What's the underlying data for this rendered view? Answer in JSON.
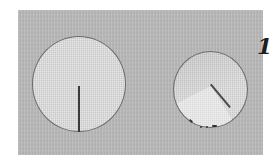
{
  "figure": {
    "label": "1",
    "items": [
      {
        "name": "flat-fabric-circle",
        "state": "flat with radial slit"
      },
      {
        "name": "cone-fabric-circle",
        "state": "overlapped into cone"
      }
    ],
    "colors": {
      "background": "#b9b9b9",
      "fabric": "#e6e6e6",
      "outline": "#6a6a6a",
      "slit": "#3b3b3b"
    }
  }
}
